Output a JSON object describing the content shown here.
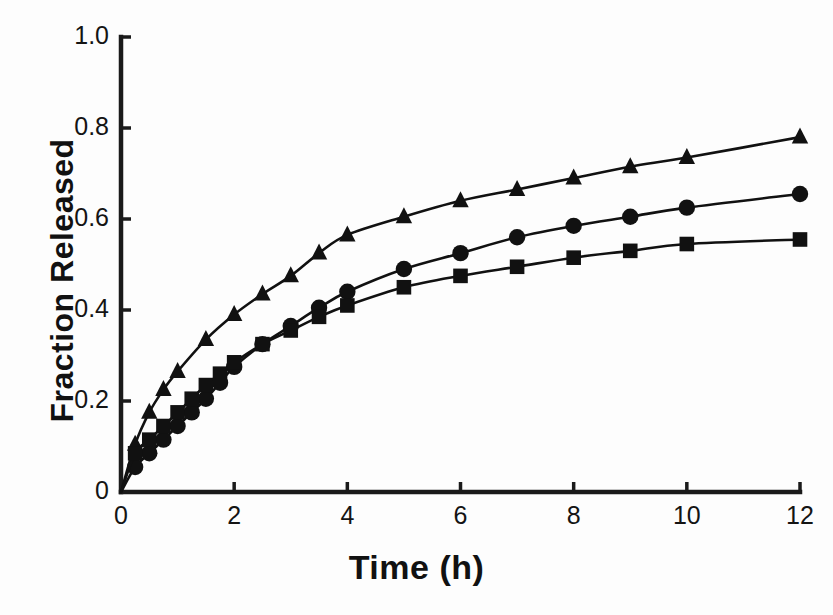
{
  "figure": {
    "background_color": "#fdfdfd",
    "ink_color": "#1a1a1a"
  },
  "axes": {
    "x_title": "Time (h)",
    "y_title": "Fraction Released",
    "x_ticks": [
      "0",
      "2",
      "4",
      "6",
      "8",
      "10",
      "12"
    ],
    "x_tick_values": [
      0,
      2,
      4,
      6,
      8,
      10,
      12
    ],
    "y_ticks": [
      "0",
      "0.2",
      "0.4",
      "0.6",
      "0.8",
      "1.0"
    ],
    "y_tick_values": [
      0,
      0.2,
      0.4,
      0.6,
      0.8,
      1.0
    ]
  },
  "chart_data": {
    "type": "line",
    "title": "",
    "subtitle": "",
    "xlabel": "Time (h)",
    "ylabel": "Fraction Released",
    "xlim": [
      0,
      12
    ],
    "ylim": [
      0,
      1.0
    ],
    "xticks": [
      0,
      2,
      4,
      6,
      8,
      10,
      12
    ],
    "yticks": [
      0,
      0.2,
      0.4,
      0.6,
      0.8,
      1.0
    ],
    "grid": false,
    "legend": "none",
    "series": [
      {
        "name": "Series A (triangles)",
        "marker": "triangle",
        "color": "#111111",
        "x": [
          0,
          0.25,
          0.5,
          0.75,
          1.0,
          1.5,
          2.0,
          2.5,
          3.0,
          3.5,
          4.0,
          5.0,
          6.0,
          7.0,
          8.0,
          9.0,
          10.0,
          12.0
        ],
        "y": [
          0.0,
          0.105,
          0.175,
          0.225,
          0.265,
          0.335,
          0.39,
          0.435,
          0.475,
          0.525,
          0.565,
          0.605,
          0.64,
          0.665,
          0.69,
          0.715,
          0.735,
          0.78
        ]
      },
      {
        "name": "Series B (circles)",
        "marker": "circle",
        "color": "#111111",
        "x": [
          0,
          0.25,
          0.5,
          0.75,
          1.0,
          1.25,
          1.5,
          1.75,
          2.0,
          2.5,
          3.0,
          3.5,
          4.0,
          5.0,
          6.0,
          7.0,
          8.0,
          9.0,
          10.0,
          12.0
        ],
        "y": [
          0.0,
          0.055,
          0.085,
          0.115,
          0.145,
          0.175,
          0.205,
          0.24,
          0.275,
          0.325,
          0.365,
          0.405,
          0.44,
          0.49,
          0.525,
          0.56,
          0.585,
          0.605,
          0.625,
          0.655
        ]
      },
      {
        "name": "Series C (squares)",
        "marker": "square",
        "color": "#111111",
        "x": [
          0,
          0.25,
          0.5,
          0.75,
          1.0,
          1.25,
          1.5,
          1.75,
          2.0,
          2.5,
          3.0,
          3.5,
          4.0,
          5.0,
          6.0,
          7.0,
          8.0,
          9.0,
          10.0,
          12.0
        ],
        "y": [
          0.0,
          0.085,
          0.115,
          0.145,
          0.175,
          0.205,
          0.235,
          0.26,
          0.285,
          0.325,
          0.355,
          0.385,
          0.41,
          0.45,
          0.475,
          0.495,
          0.515,
          0.53,
          0.545,
          0.555
        ]
      }
    ]
  }
}
